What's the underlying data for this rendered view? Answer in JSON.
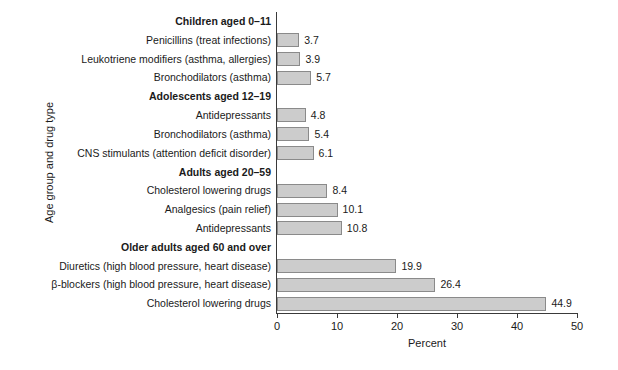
{
  "chart_data": {
    "type": "bar",
    "orientation": "horizontal",
    "title": "",
    "xlabel": "Percent",
    "ylabel": "Age group and drug type",
    "xlim": [
      0,
      50
    ],
    "xticks": [
      0,
      10,
      20,
      30,
      40,
      50
    ],
    "grid": false,
    "legend": null,
    "bar_color": "#cccccc",
    "bar_edge_color": "#8a8a8a",
    "rows": [
      {
        "label": "Children aged 0–11",
        "group": true,
        "value": null
      },
      {
        "label": "Penicillins (treat infections)",
        "group": false,
        "value": 3.7
      },
      {
        "label": "Leukotriene modifiers (asthma, allergies)",
        "group": false,
        "value": 3.9
      },
      {
        "label": "Bronchodilators (asthma)",
        "group": false,
        "value": 5.7
      },
      {
        "label": "Adolescents aged 12–19",
        "group": true,
        "value": null
      },
      {
        "label": "Antidepressants",
        "group": false,
        "value": 4.8
      },
      {
        "label": "Bronchodilators (asthma)",
        "group": false,
        "value": 5.4
      },
      {
        "label": "CNS stimulants (attention deficit disorder)",
        "group": false,
        "value": 6.1
      },
      {
        "label": "Adults aged 20–59",
        "group": true,
        "value": null
      },
      {
        "label": "Cholesterol lowering drugs",
        "group": false,
        "value": 8.4
      },
      {
        "label": "Analgesics (pain relief)",
        "group": false,
        "value": 10.1
      },
      {
        "label": "Antidepressants",
        "group": false,
        "value": 10.8
      },
      {
        "label": "Older adults aged 60 and over",
        "group": true,
        "value": null
      },
      {
        "label": "Diuretics (high blood pressure, heart disease)",
        "group": false,
        "value": 19.9
      },
      {
        "label": "β-blockers (high blood pressure, heart disease)",
        "group": false,
        "value": 26.4
      },
      {
        "label": "Cholesterol lowering drugs",
        "group": false,
        "value": 44.9
      }
    ],
    "categories": [
      "Penicillins (treat infections)",
      "Leukotriene modifiers (asthma, allergies)",
      "Bronchodilators (asthma)",
      "Antidepressants",
      "Bronchodilators (asthma)",
      "CNS stimulants (attention deficit disorder)",
      "Cholesterol lowering drugs",
      "Analgesics (pain relief)",
      "Antidepressants",
      "Diuretics (high blood pressure, heart disease)",
      "β-blockers (high blood pressure, heart disease)",
      "Cholesterol lowering drugs"
    ],
    "values": [
      3.7,
      3.9,
      5.7,
      4.8,
      5.4,
      6.1,
      8.4,
      10.1,
      10.8,
      19.9,
      26.4,
      44.9
    ],
    "groups": [
      "Children aged 0–11",
      "Adolescents aged 12–19",
      "Adults aged 20–59",
      "Older adults aged 60 and over"
    ]
  }
}
